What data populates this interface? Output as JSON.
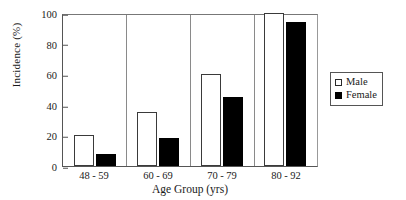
{
  "chart_data": {
    "type": "bar",
    "title": "",
    "categories": [
      "48 - 59",
      "60 - 69",
      "70 - 79",
      "80 - 92"
    ],
    "series": [
      {
        "name": "Male",
        "values": [
          20,
          35,
          60,
          100
        ],
        "swatch": "hollow-square",
        "color": "#ffffff"
      },
      {
        "name": "Female",
        "values": [
          8,
          18,
          45,
          94
        ],
        "swatch": "filled-square",
        "color": "#000000"
      }
    ],
    "xlabel": "Age Group (yrs)",
    "ylabel": "Incidence (%)",
    "ylim": [
      0,
      100
    ],
    "yticks": [
      0,
      20,
      40,
      60,
      80,
      100
    ],
    "grid": false,
    "legend_position": "right-outside"
  },
  "axes": {
    "y_title": "Incidence (%)",
    "x_title": "Age Group (yrs)",
    "y_ticks": [
      "0",
      "20",
      "40",
      "60",
      "80",
      "100"
    ],
    "x_ticks": [
      "48 - 59",
      "60 - 69",
      "70 - 79",
      "80 - 92"
    ]
  },
  "legend": {
    "entries": [
      {
        "label": "Male",
        "icon": "hollow-square-icon"
      },
      {
        "label": "Female",
        "icon": "filled-square-icon"
      }
    ]
  },
  "colors": {
    "male": "#ffffff",
    "female": "#000000",
    "axis": "#555555",
    "text": "#1a1a1a",
    "background": "#ffffff"
  }
}
